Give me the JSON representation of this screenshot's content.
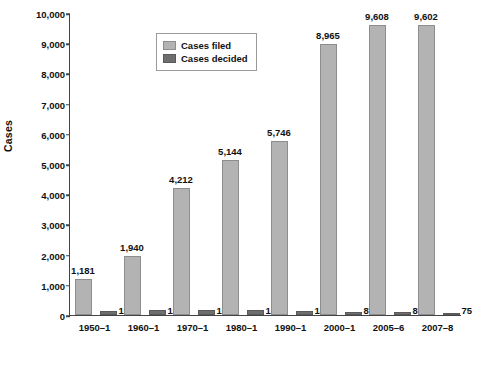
{
  "chart_data": {
    "type": "bar",
    "title": "",
    "xlabel": "",
    "ylabel": "Cases",
    "ylim": [
      0,
      10000
    ],
    "yticks": [
      "0",
      "1,000",
      "2,000",
      "3,000",
      "4,000",
      "5,000",
      "6,000",
      "7,000",
      "8,000",
      "9,000",
      "10,000"
    ],
    "grid": false,
    "legend_position": "top-left",
    "categories": [
      "1950–1",
      "1960–1",
      "1970–1",
      "1980–1",
      "1990–1",
      "2000–1",
      "2005–6",
      "2007–8"
    ],
    "series": [
      {
        "name": "Cases filed",
        "color": "#b3b3b3",
        "values": [
          1181,
          1940,
          4212,
          5144,
          5746,
          8965,
          9608,
          9602
        ],
        "labels": [
          "1,181",
          "1,940",
          "4,212",
          "5,144",
          "5,746",
          "8,965",
          "9,608",
          "9,602"
        ]
      },
      {
        "name": "Cases decided",
        "color": "#6e6e6e",
        "values": [
          125,
          150,
          158,
          152,
          146,
          87,
          88,
          75
        ],
        "labels": [
          "125",
          "150",
          "158",
          "152",
          "146",
          "87",
          "88",
          "75"
        ]
      }
    ]
  }
}
